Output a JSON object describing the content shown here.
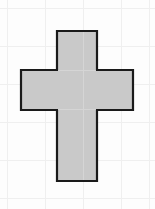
{
  "figure": {
    "title": "",
    "kind": "geometric-shape-figure",
    "shape_name": "cross"
  },
  "canvas": {
    "width": 155,
    "height": 209,
    "background_color": "#fdfdfd",
    "page_color": "#ffffff"
  },
  "grid": {
    "visible": true,
    "line_color": "#efefef",
    "line_width": 1,
    "cell_size": 38,
    "origin_x": 7,
    "origin_y": 8,
    "x_lines": [
      7,
      45,
      83,
      121,
      149
    ],
    "y_lines": [
      8,
      46,
      84,
      122,
      160,
      198
    ]
  },
  "shape": {
    "name": "cross",
    "fill_color": "#c9c9c9",
    "stroke_color": "#1a1a1a",
    "stroke_width": 2.2,
    "vertical_bar": {
      "x": 57,
      "y": 31,
      "width": 40,
      "height": 150
    },
    "horizontal_bar": {
      "x": 21,
      "y": 70,
      "width": 112,
      "height": 40
    },
    "bounds": {
      "left": 21,
      "top": 31,
      "right": 133,
      "bottom": 181,
      "width": 112,
      "height": 150
    },
    "vertices": [
      [
        57,
        31
      ],
      [
        97,
        31
      ],
      [
        97,
        70
      ],
      [
        133,
        70
      ],
      [
        133,
        110
      ],
      [
        97,
        110
      ],
      [
        97,
        181
      ],
      [
        57,
        181
      ],
      [
        57,
        110
      ],
      [
        21,
        110
      ],
      [
        21,
        70
      ],
      [
        57,
        70
      ]
    ],
    "vertex_count": 12,
    "path": "M 57 31 L 97 31 L 97 70 L 133 70 L 133 110 L 97 110 L 97 181 L 57 181 L 57 110 L 21 110 L 21 70 L 57 70 Z"
  },
  "interior_guides": {
    "visible": true,
    "line_color": "#d8d8d8",
    "segments": [
      {
        "x1": 57,
        "y1": 70,
        "x2": 97,
        "y2": 70
      },
      {
        "x1": 57,
        "y1": 110,
        "x2": 97,
        "y2": 110
      },
      {
        "x1": 83,
        "y1": 31,
        "x2": 83,
        "y2": 181
      }
    ]
  }
}
